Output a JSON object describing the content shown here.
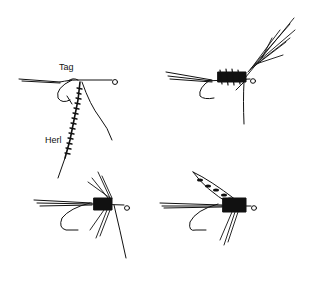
{
  "figure": {
    "background": "#ffffff",
    "ink": "#111111",
    "labels": {
      "tag": "Tag",
      "herl": "Herl"
    },
    "panels": [
      {
        "id": 1,
        "position": "top-left",
        "stage": "tag and herl tied in on hook shank"
      },
      {
        "id": 2,
        "position": "top-right",
        "stage": "herl body wrapped, hackle tied in"
      },
      {
        "id": 3,
        "position": "bottom-left",
        "stage": "hackle wound"
      },
      {
        "id": 4,
        "position": "bottom-right",
        "stage": "wing added, finished fly"
      }
    ]
  }
}
